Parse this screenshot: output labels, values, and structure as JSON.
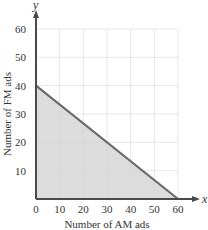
{
  "chart_data": {
    "type": "area",
    "title": "",
    "xlabel": "Number of AM ads",
    "ylabel": "Number of FM ads",
    "x_axis_var": "x",
    "y_axis_var": "y",
    "xlim": [
      0,
      60
    ],
    "ylim": [
      0,
      60
    ],
    "x_ticks": [
      0,
      10,
      20,
      30,
      40,
      50,
      60
    ],
    "y_ticks": [
      10,
      20,
      30,
      40,
      50,
      60
    ],
    "grid": true,
    "feasible_region": {
      "description": "Shaded triangle bounded by x = 0, y = 0 and the line from (0,40) to (60,0)",
      "vertices": [
        [
          0,
          0
        ],
        [
          0,
          40
        ],
        [
          60,
          0
        ]
      ],
      "boundary_line": {
        "from": [
          0,
          40
        ],
        "to": [
          60,
          0
        ]
      }
    },
    "colors": {
      "fill": "#d6d6d6",
      "boundary": "#6a6a6a",
      "axis": "#4a4a4a",
      "grid": "#e6e6e6"
    }
  }
}
